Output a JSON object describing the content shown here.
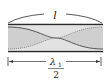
{
  "diagram": {
    "type": "standing-wave-in-tube",
    "length_label": "l",
    "wavelength_label": {
      "numerator_symbol": "λ",
      "numerator_subscript": "1",
      "denominator": "2"
    },
    "colors": {
      "wall": "#2a2a2a",
      "fill": "#d9d9d9",
      "wave_solid": "#555555",
      "wave_dotted": "#888888",
      "arrow": "#333333"
    }
  }
}
